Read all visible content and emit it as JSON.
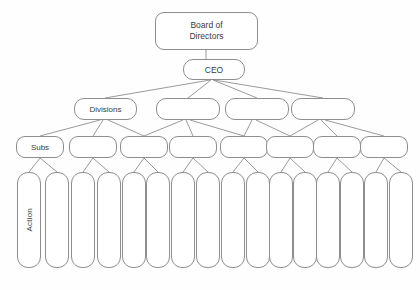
{
  "diagram": {
    "title_text": "Board of\nDirectors",
    "stroke_color": "#8e8e8e",
    "text_color": "#3a3a3a",
    "background_color": "#fefefe",
    "levels": [
      {
        "name": "board",
        "nodes": [
          {
            "label": "Board of\nDirectors",
            "x": 155,
            "y": 12,
            "w": 103,
            "h": 38
          }
        ]
      },
      {
        "name": "ceo",
        "nodes": [
          {
            "label": "CEO",
            "x": 183,
            "y": 59,
            "w": 62,
            "h": 21
          }
        ]
      },
      {
        "name": "divisions",
        "nodes": [
          {
            "label": "Divisions",
            "x": 74,
            "y": 98,
            "w": 63,
            "h": 22
          },
          {
            "label": "",
            "x": 156,
            "y": 98,
            "w": 64,
            "h": 22
          },
          {
            "label": "",
            "x": 225,
            "y": 98,
            "w": 64,
            "h": 22
          },
          {
            "label": "",
            "x": 291,
            "y": 98,
            "w": 64,
            "h": 22
          }
        ]
      },
      {
        "name": "subs",
        "nodes": [
          {
            "label": "Subs",
            "x": 16,
            "y": 136,
            "w": 48,
            "h": 22
          },
          {
            "label": "",
            "x": 69,
            "y": 136,
            "w": 48,
            "h": 22
          },
          {
            "label": "",
            "x": 120,
            "y": 136,
            "w": 48,
            "h": 22
          },
          {
            "label": "",
            "x": 169,
            "y": 136,
            "w": 48,
            "h": 22
          },
          {
            "label": "",
            "x": 220,
            "y": 136,
            "w": 48,
            "h": 22
          },
          {
            "label": "",
            "x": 266,
            "y": 136,
            "w": 48,
            "h": 22
          },
          {
            "label": "",
            "x": 313,
            "y": 136,
            "w": 48,
            "h": 22
          },
          {
            "label": "",
            "x": 360,
            "y": 136,
            "w": 48,
            "h": 22
          },
          {
            "label": "",
            "x": 264,
            "y": 136,
            "w": 0,
            "h": 0
          }
        ]
      },
      {
        "name": "action",
        "nodes": [
          {
            "label": "Action",
            "x": 17,
            "y": 172,
            "w": 24,
            "h": 96
          },
          {
            "label": "",
            "x": 45,
            "y": 172,
            "w": 24,
            "h": 96
          },
          {
            "label": "",
            "x": 71,
            "y": 172,
            "w": 24,
            "h": 96
          },
          {
            "label": "",
            "x": 97,
            "y": 172,
            "w": 24,
            "h": 96
          },
          {
            "label": "",
            "x": 122,
            "y": 172,
            "w": 24,
            "h": 96
          },
          {
            "label": "",
            "x": 146,
            "y": 172,
            "w": 24,
            "h": 96
          },
          {
            "label": "",
            "x": 171,
            "y": 172,
            "w": 24,
            "h": 96
          },
          {
            "label": "",
            "x": 196,
            "y": 172,
            "w": 24,
            "h": 96
          },
          {
            "label": "",
            "x": 221,
            "y": 172,
            "w": 24,
            "h": 96
          },
          {
            "label": "",
            "x": 246,
            "y": 172,
            "w": 24,
            "h": 96
          },
          {
            "label": "",
            "x": 269,
            "y": 172,
            "w": 24,
            "h": 96
          },
          {
            "label": "",
            "x": 293,
            "y": 172,
            "w": 24,
            "h": 96
          },
          {
            "label": "",
            "x": 316,
            "y": 172,
            "w": 24,
            "h": 96
          },
          {
            "label": "",
            "x": 340,
            "y": 172,
            "w": 24,
            "h": 96
          },
          {
            "label": "",
            "x": 364,
            "y": 172,
            "w": 24,
            "h": 96
          },
          {
            "label": "",
            "x": 389,
            "y": 172,
            "w": 24,
            "h": 96
          }
        ]
      }
    ],
    "connectors": [
      {
        "x1": 206,
        "y1": 50,
        "x2": 206,
        "y2": 59
      },
      {
        "x1": 210,
        "y1": 80,
        "x2": 105,
        "y2": 98
      },
      {
        "x1": 211,
        "y1": 80,
        "x2": 188,
        "y2": 98
      },
      {
        "x1": 213,
        "y1": 80,
        "x2": 257,
        "y2": 98
      },
      {
        "x1": 214,
        "y1": 80,
        "x2": 323,
        "y2": 98
      },
      {
        "x1": 100,
        "y1": 120,
        "x2": 40,
        "y2": 136
      },
      {
        "x1": 103,
        "y1": 120,
        "x2": 93,
        "y2": 136
      },
      {
        "x1": 108,
        "y1": 120,
        "x2": 144,
        "y2": 136
      },
      {
        "x1": 183,
        "y1": 120,
        "x2": 144,
        "y2": 136
      },
      {
        "x1": 186,
        "y1": 120,
        "x2": 193,
        "y2": 136
      },
      {
        "x1": 190,
        "y1": 120,
        "x2": 244,
        "y2": 136
      },
      {
        "x1": 252,
        "y1": 120,
        "x2": 244,
        "y2": 136
      },
      {
        "x1": 256,
        "y1": 120,
        "x2": 290,
        "y2": 136
      },
      {
        "x1": 318,
        "y1": 120,
        "x2": 290,
        "y2": 136
      },
      {
        "x1": 321,
        "y1": 120,
        "x2": 337,
        "y2": 136
      },
      {
        "x1": 325,
        "y1": 120,
        "x2": 384,
        "y2": 136
      },
      {
        "x1": 40,
        "y1": 158,
        "x2": 29,
        "y2": 172
      },
      {
        "x1": 40,
        "y1": 158,
        "x2": 57,
        "y2": 172
      },
      {
        "x1": 93,
        "y1": 158,
        "x2": 83,
        "y2": 172
      },
      {
        "x1": 93,
        "y1": 158,
        "x2": 109,
        "y2": 172
      },
      {
        "x1": 144,
        "y1": 158,
        "x2": 134,
        "y2": 172
      },
      {
        "x1": 144,
        "y1": 158,
        "x2": 158,
        "y2": 172
      },
      {
        "x1": 193,
        "y1": 158,
        "x2": 183,
        "y2": 172
      },
      {
        "x1": 193,
        "y1": 158,
        "x2": 208,
        "y2": 172
      },
      {
        "x1": 244,
        "y1": 158,
        "x2": 233,
        "y2": 172
      },
      {
        "x1": 244,
        "y1": 158,
        "x2": 258,
        "y2": 172
      },
      {
        "x1": 290,
        "y1": 158,
        "x2": 281,
        "y2": 172
      },
      {
        "x1": 290,
        "y1": 158,
        "x2": 305,
        "y2": 172
      },
      {
        "x1": 337,
        "y1": 158,
        "x2": 328,
        "y2": 172
      },
      {
        "x1": 337,
        "y1": 158,
        "x2": 352,
        "y2": 172
      },
      {
        "x1": 384,
        "y1": 158,
        "x2": 376,
        "y2": 172
      },
      {
        "x1": 384,
        "y1": 158,
        "x2": 401,
        "y2": 172
      }
    ]
  }
}
